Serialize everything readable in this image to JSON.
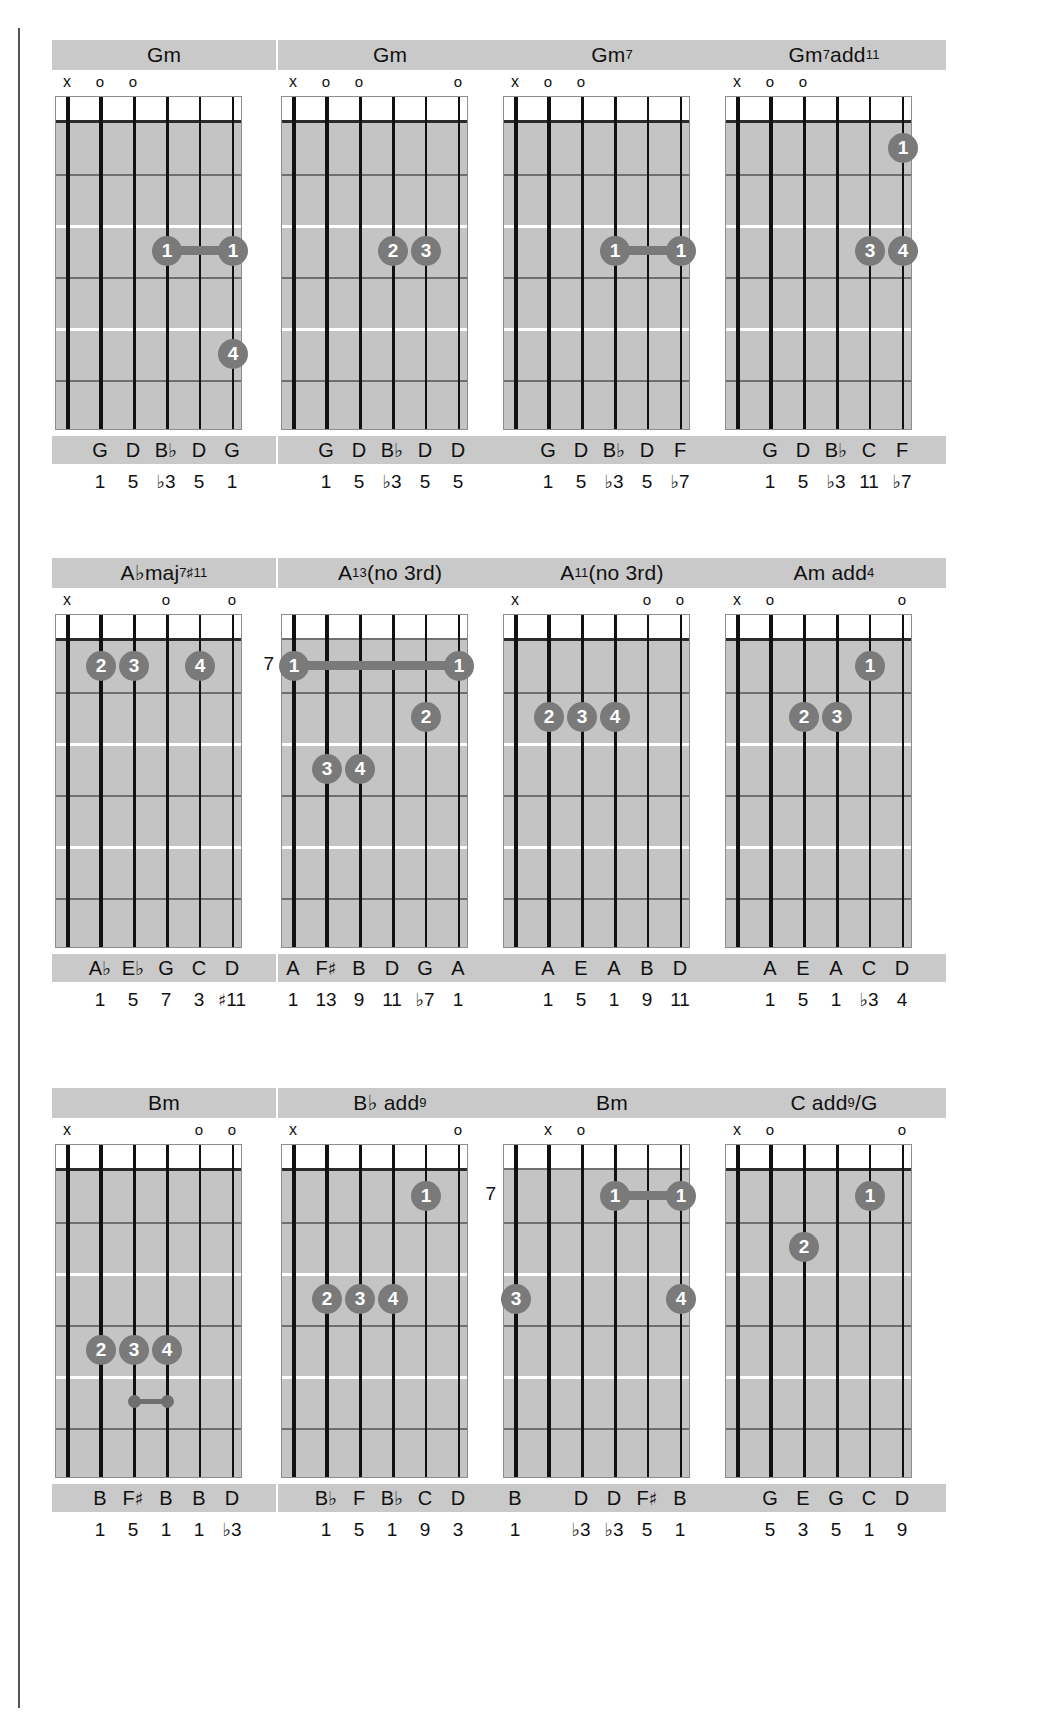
{
  "page": {
    "rows": 3,
    "columns": 4,
    "colors": {
      "fretboard": "#c4c4c4",
      "band": "#c9c9c9",
      "dot": "#7a7a7a",
      "string": "#111111",
      "fret": "#6f6f6f",
      "text": "#111111"
    },
    "legend": {
      "muted": "x",
      "open": "o"
    }
  },
  "chords": [
    {
      "id": "gm-1",
      "name_html": "Gm",
      "name_text": "Gm",
      "base_fret": null,
      "base_fret_label": "",
      "has_nut": true,
      "markers": [
        "x",
        "o",
        "o",
        "",
        "",
        ""
      ],
      "dots": [
        {
          "string": 4,
          "fret": 3,
          "finger": "1"
        },
        {
          "string": 6,
          "fret": 3,
          "finger": "1"
        },
        {
          "string": 6,
          "fret": 5,
          "finger": "4"
        }
      ],
      "barres": [
        {
          "fret": 3,
          "from_string": 4,
          "to_string": 6,
          "style": "thick"
        }
      ],
      "notes": [
        "",
        "G",
        "D",
        "B♭",
        "D",
        "G"
      ],
      "intervals": [
        "",
        "1",
        "5",
        "♭3",
        "5",
        "1"
      ]
    },
    {
      "id": "gm-2",
      "name_html": "Gm",
      "name_text": "Gm",
      "base_fret": null,
      "base_fret_label": "",
      "has_nut": true,
      "markers": [
        "x",
        "o",
        "o",
        "",
        "",
        "o"
      ],
      "dots": [
        {
          "string": 4,
          "fret": 3,
          "finger": "2"
        },
        {
          "string": 5,
          "fret": 3,
          "finger": "3"
        }
      ],
      "barres": [],
      "notes": [
        "",
        "G",
        "D",
        "B♭",
        "D",
        "D"
      ],
      "intervals": [
        "",
        "1",
        "5",
        "♭3",
        "5",
        "5"
      ]
    },
    {
      "id": "gm7",
      "name_html": "Gm<sup>7</sup>",
      "name_text": "Gm7",
      "base_fret": null,
      "base_fret_label": "",
      "has_nut": true,
      "markers": [
        "x",
        "o",
        "o",
        "",
        "",
        ""
      ],
      "dots": [
        {
          "string": 4,
          "fret": 3,
          "finger": "1"
        },
        {
          "string": 6,
          "fret": 3,
          "finger": "1"
        }
      ],
      "barres": [
        {
          "fret": 3,
          "from_string": 4,
          "to_string": 6,
          "style": "thick"
        }
      ],
      "notes": [
        "",
        "G",
        "D",
        "B♭",
        "D",
        "F"
      ],
      "intervals": [
        "",
        "1",
        "5",
        "♭3",
        "5",
        "♭7"
      ]
    },
    {
      "id": "gm7add11",
      "name_html": "Gm<sup>7</sup>add<sup>11</sup>",
      "name_text": "Gm7add11",
      "base_fret": null,
      "base_fret_label": "",
      "has_nut": true,
      "markers": [
        "x",
        "o",
        "o",
        "",
        "",
        ""
      ],
      "dots": [
        {
          "string": 6,
          "fret": 1,
          "finger": "1"
        },
        {
          "string": 5,
          "fret": 3,
          "finger": "3"
        },
        {
          "string": 6,
          "fret": 3,
          "finger": "4"
        }
      ],
      "barres": [],
      "notes": [
        "",
        "G",
        "D",
        "B♭",
        "C",
        "F"
      ],
      "intervals": [
        "",
        "1",
        "5",
        "♭3",
        "11",
        "♭7"
      ]
    },
    {
      "id": "abmaj7s11",
      "name_html": "A♭maj<sup>7♯11</sup>",
      "name_text": "Abmaj7#11",
      "base_fret": null,
      "base_fret_label": "",
      "has_nut": true,
      "markers": [
        "x",
        "",
        "",
        "o",
        "",
        "o"
      ],
      "dots": [
        {
          "string": 2,
          "fret": 1,
          "finger": "2"
        },
        {
          "string": 3,
          "fret": 1,
          "finger": "3"
        },
        {
          "string": 5,
          "fret": 1,
          "finger": "4"
        }
      ],
      "barres": [],
      "notes": [
        "",
        "A♭",
        "E♭",
        "G",
        "C",
        "D"
      ],
      "intervals": [
        "",
        "1",
        "5",
        "7",
        "3",
        "♯11"
      ]
    },
    {
      "id": "a13no3",
      "name_html": "A<sup>13</sup>(no 3rd)",
      "name_text": "A13(no 3rd)",
      "base_fret": 7,
      "base_fret_label": "7",
      "has_nut": false,
      "markers": [
        "",
        "",
        "",
        "",
        "",
        ""
      ],
      "dots": [
        {
          "string": 1,
          "fret": 1,
          "finger": "1"
        },
        {
          "string": 6,
          "fret": 1,
          "finger": "1"
        },
        {
          "string": 5,
          "fret": 2,
          "finger": "2"
        },
        {
          "string": 2,
          "fret": 3,
          "finger": "3"
        },
        {
          "string": 3,
          "fret": 3,
          "finger": "4"
        }
      ],
      "barres": [
        {
          "fret": 1,
          "from_string": 1,
          "to_string": 6,
          "style": "thick"
        }
      ],
      "notes": [
        "A",
        "F♯",
        "B",
        "D",
        "G",
        "A"
      ],
      "intervals": [
        "1",
        "13",
        "9",
        "11",
        "♭7",
        "1"
      ]
    },
    {
      "id": "a11no3",
      "name_html": "A<sup>11</sup>(no 3rd)",
      "name_text": "A11(no 3rd)",
      "base_fret": null,
      "base_fret_label": "",
      "has_nut": true,
      "markers": [
        "x",
        "",
        "",
        "",
        "o",
        "o"
      ],
      "dots": [
        {
          "string": 2,
          "fret": 2,
          "finger": "2"
        },
        {
          "string": 3,
          "fret": 2,
          "finger": "3"
        },
        {
          "string": 4,
          "fret": 2,
          "finger": "4"
        }
      ],
      "barres": [],
      "notes": [
        "",
        "A",
        "E",
        "A",
        "B",
        "D"
      ],
      "intervals": [
        "",
        "1",
        "5",
        "1",
        "9",
        "11"
      ]
    },
    {
      "id": "amadd4",
      "name_html": "Am add<sup>4</sup>",
      "name_text": "Am add4",
      "base_fret": null,
      "base_fret_label": "",
      "has_nut": true,
      "markers": [
        "x",
        "o",
        "",
        "",
        "",
        "o"
      ],
      "dots": [
        {
          "string": 5,
          "fret": 1,
          "finger": "1"
        },
        {
          "string": 3,
          "fret": 2,
          "finger": "2"
        },
        {
          "string": 4,
          "fret": 2,
          "finger": "3"
        }
      ],
      "barres": [],
      "notes": [
        "",
        "A",
        "E",
        "A",
        "C",
        "D"
      ],
      "intervals": [
        "",
        "1",
        "5",
        "1",
        "♭3",
        "4"
      ]
    },
    {
      "id": "bm",
      "name_html": "Bm",
      "name_text": "Bm",
      "base_fret": null,
      "base_fret_label": "",
      "has_nut": true,
      "markers": [
        "x",
        "",
        "",
        "",
        "o",
        "o"
      ],
      "dots": [
        {
          "string": 2,
          "fret": 4,
          "finger": "2"
        },
        {
          "string": 3,
          "fret": 4,
          "finger": "3"
        },
        {
          "string": 4,
          "fret": 4,
          "finger": "4"
        }
      ],
      "barres": [],
      "mini": [
        {
          "fret": 5,
          "from_string": 3,
          "to_string": 4
        }
      ],
      "notes": [
        "",
        "B",
        "F♯",
        "B",
        "B",
        "D"
      ],
      "intervals": [
        "",
        "1",
        "5",
        "1",
        "1",
        "♭3"
      ]
    },
    {
      "id": "bbadd9",
      "name_html": "B♭ add<sup>9</sup>",
      "name_text": "Bb add9",
      "base_fret": null,
      "base_fret_label": "",
      "has_nut": true,
      "markers": [
        "x",
        "",
        "",
        "",
        "",
        "o"
      ],
      "dots": [
        {
          "string": 5,
          "fret": 1,
          "finger": "1"
        },
        {
          "string": 2,
          "fret": 3,
          "finger": "2"
        },
        {
          "string": 3,
          "fret": 3,
          "finger": "3"
        },
        {
          "string": 4,
          "fret": 3,
          "finger": "4"
        }
      ],
      "barres": [],
      "notes": [
        "",
        "B♭",
        "F",
        "B♭",
        "C",
        "D"
      ],
      "intervals": [
        "",
        "1",
        "5",
        "1",
        "9",
        "3"
      ]
    },
    {
      "id": "bm-2",
      "name_html": "Bm",
      "name_text": "Bm",
      "base_fret": 7,
      "base_fret_label": "7",
      "has_nut": false,
      "markers": [
        "",
        "x",
        "o",
        "",
        "",
        ""
      ],
      "dots": [
        {
          "string": 4,
          "fret": 1,
          "finger": "1"
        },
        {
          "string": 6,
          "fret": 1,
          "finger": "1"
        },
        {
          "string": 1,
          "fret": 3,
          "finger": "3"
        },
        {
          "string": 6,
          "fret": 3,
          "finger": "4"
        }
      ],
      "barres": [
        {
          "fret": 1,
          "from_string": 4,
          "to_string": 6,
          "style": "thick"
        }
      ],
      "notes": [
        "B",
        "",
        "D",
        "D",
        "F♯",
        "B"
      ],
      "intervals": [
        "1",
        "",
        "♭3",
        "♭3",
        "5",
        "1"
      ]
    },
    {
      "id": "cadd9g",
      "name_html": "C add<sup>9</sup>/G",
      "name_text": "C add9/G",
      "base_fret": null,
      "base_fret_label": "",
      "has_nut": true,
      "markers": [
        "x",
        "o",
        "",
        "",
        "",
        "o"
      ],
      "dots": [
        {
          "string": 5,
          "fret": 1,
          "finger": "1"
        },
        {
          "string": 3,
          "fret": 2,
          "finger": "2"
        }
      ],
      "barres": [],
      "notes": [
        "",
        "G",
        "E",
        "G",
        "C",
        "D"
      ],
      "intervals": [
        "",
        "5",
        "3",
        "5",
        "1",
        "9"
      ]
    }
  ]
}
